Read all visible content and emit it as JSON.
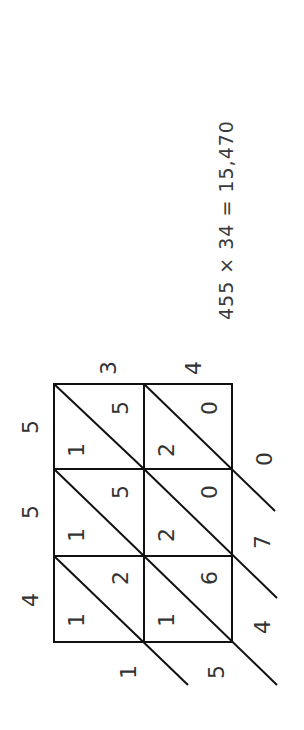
{
  "equation": {
    "text": "455 × 34 = 15,470",
    "multiplicand": "455",
    "multiplier": "34",
    "product": "15,470"
  },
  "lattice": {
    "orientation": "rotated 90° clockwise",
    "multiplicand_digits": [
      "4",
      "5",
      "5"
    ],
    "multiplier_digits": [
      "3",
      "4"
    ],
    "cells": [
      {
        "row_digit": "5",
        "col_digit": "3",
        "tens": "1",
        "ones": "5"
      },
      {
        "row_digit": "5",
        "col_digit": "4",
        "tens": "2",
        "ones": "0"
      },
      {
        "row_digit": "5",
        "col_digit": "3",
        "tens": "1",
        "ones": "5"
      },
      {
        "row_digit": "5",
        "col_digit": "4",
        "tens": "2",
        "ones": "0"
      },
      {
        "row_digit": "4",
        "col_digit": "3",
        "tens": "1",
        "ones": "2"
      },
      {
        "row_digit": "4",
        "col_digit": "4",
        "tens": "1",
        "ones": "6"
      }
    ],
    "result_digits": [
      "1",
      "5",
      "4",
      "7",
      "0"
    ]
  },
  "colors": {
    "lines": "#111111",
    "text": "#333333",
    "background": "#ffffff"
  }
}
